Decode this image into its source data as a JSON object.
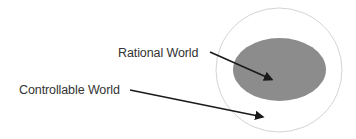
{
  "diagram": {
    "type": "nested-sets",
    "outer_set": {
      "label": "Controllable World",
      "fill": "#ffffff",
      "stroke": "#d0d0d0"
    },
    "inner_set": {
      "label": "Rational World",
      "fill": "#8c8c8c"
    },
    "labels": {
      "rational": "Rational World",
      "controllable": "Controllable World"
    },
    "colors": {
      "arrow": "#1a1a1a",
      "text": "#333333"
    }
  }
}
